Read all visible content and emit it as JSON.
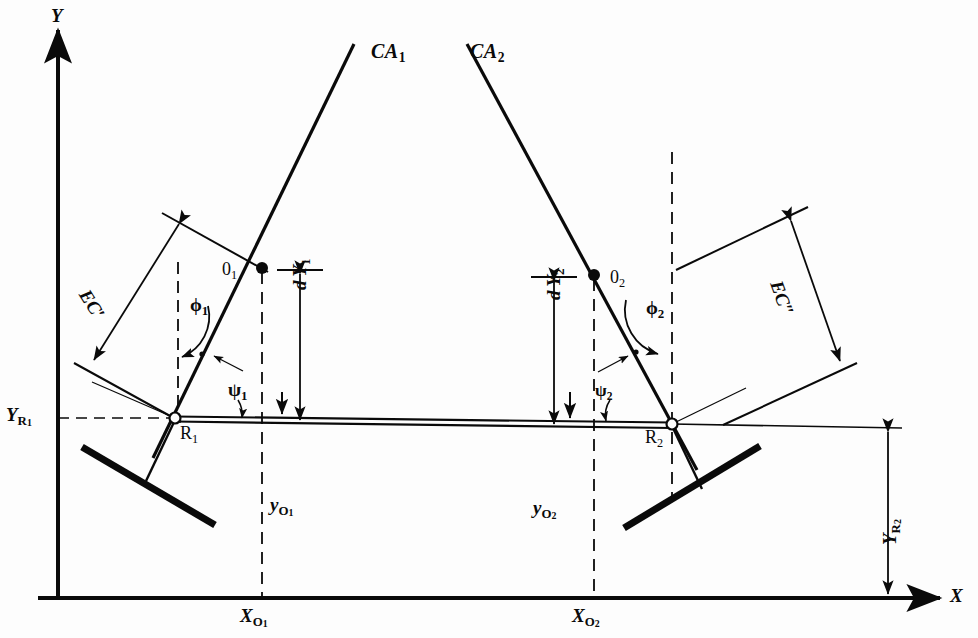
{
  "figure": {
    "background_color": "#fdfdfd",
    "line_color": "#0a0a0a"
  },
  "axes": {
    "y_label": "Y",
    "x_label": "X",
    "origin_px": {
      "x": 58,
      "y": 598
    }
  },
  "control_arms": [
    {
      "id": "ca1",
      "label": "CA",
      "sub": "1"
    },
    {
      "id": "ca2",
      "label": "CA",
      "sub": "2"
    }
  ],
  "points": [
    {
      "id": "o1",
      "label": "0",
      "sub": "1",
      "x": 262,
      "y": 268
    },
    {
      "id": "o2",
      "label": "0",
      "sub": "2",
      "x": 594,
      "y": 275
    },
    {
      "id": "r1",
      "label": "R",
      "sub": "1",
      "x": 175,
      "y": 418
    },
    {
      "id": "r2",
      "label": "R",
      "sub": "2",
      "x": 672,
      "y": 424
    }
  ],
  "lengths": [
    {
      "id": "ec1",
      "label": "EC′"
    },
    {
      "id": "ec2",
      "label": "EC″"
    }
  ],
  "angles": [
    {
      "id": "phi1",
      "symbol": "ϕ",
      "sub": "1"
    },
    {
      "id": "phi2",
      "symbol": "ϕ",
      "sub": "2"
    },
    {
      "id": "psi1",
      "symbol": "ψ",
      "sub": "1"
    },
    {
      "id": "psi2",
      "symbol": "ψ",
      "sub": "2"
    }
  ],
  "dimensions": [
    {
      "id": "dy1",
      "prefix": "d",
      "label": "Y",
      "sub": "1"
    },
    {
      "id": "dy2",
      "prefix": "d",
      "label": "Y",
      "sub": "2"
    },
    {
      "id": "yo1",
      "label": "y",
      "sub": "O",
      "subsub": "1"
    },
    {
      "id": "yo2",
      "label": "y",
      "sub": "O",
      "subsub": "2"
    },
    {
      "id": "xo1",
      "label": "X",
      "sub": "O",
      "subsub": "1"
    },
    {
      "id": "xo2",
      "label": "X",
      "sub": "O",
      "subsub": "2"
    },
    {
      "id": "yr1",
      "label": "Y",
      "sub": "R",
      "subsub": "1"
    },
    {
      "id": "yr2",
      "label": "Y",
      "sub": "R",
      "subsub": "2"
    }
  ]
}
